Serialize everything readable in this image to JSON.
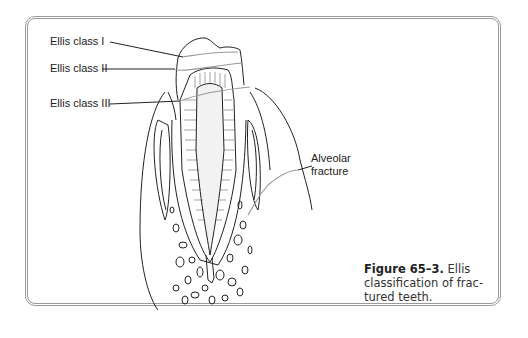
{
  "figure": {
    "labels": {
      "class1": "Ellis class I",
      "class2": "Ellis class II",
      "class3": "Ellis class III",
      "alveolar_line1": "Alveolar",
      "alveolar_line2": "fracture"
    },
    "caption": {
      "number": "Figure 65–3.",
      "line1_text": " Ellis",
      "line2": "classification of frac-",
      "line3": "tured teeth."
    }
  },
  "colors": {
    "border": "#9a9a9a",
    "ink": "#222222",
    "fracture_line": "#999999"
  }
}
